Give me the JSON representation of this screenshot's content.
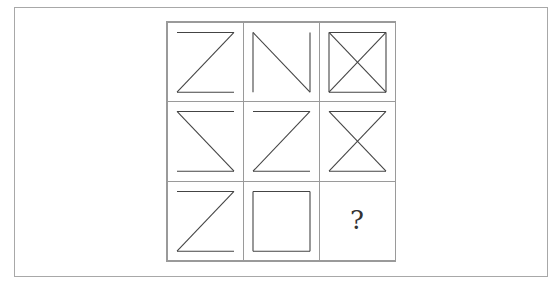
{
  "puzzle": {
    "type": "3x3 figure matrix",
    "missing_symbol": "?",
    "cells": [
      {
        "row": 1,
        "col": 1,
        "figure": "Z shape",
        "strokes": [
          "top",
          "diag-tr-bl",
          "bottom"
        ]
      },
      {
        "row": 1,
        "col": 2,
        "figure": "N shape",
        "strokes": [
          "left",
          "diag-tl-br",
          "right"
        ]
      },
      {
        "row": 1,
        "col": 3,
        "figure": "square with X",
        "strokes": [
          "top",
          "bottom",
          "left",
          "right",
          "diag-tl-br",
          "diag-tr-bl"
        ]
      },
      {
        "row": 2,
        "col": 1,
        "figure": "reverse Z shape",
        "strokes": [
          "top",
          "diag-tl-br",
          "bottom"
        ]
      },
      {
        "row": 2,
        "col": 2,
        "figure": "Z shape",
        "strokes": [
          "top",
          "diag-tr-bl",
          "bottom"
        ]
      },
      {
        "row": 2,
        "col": 3,
        "figure": "hourglass",
        "strokes": [
          "top",
          "diag-tl-br",
          "diag-tr-bl",
          "bottom"
        ]
      },
      {
        "row": 3,
        "col": 1,
        "figure": "Z shape",
        "strokes": [
          "top",
          "diag-tr-bl",
          "bottom"
        ]
      },
      {
        "row": 3,
        "col": 2,
        "figure": "square",
        "strokes": [
          "top",
          "bottom",
          "left",
          "right"
        ]
      },
      {
        "row": 3,
        "col": 3,
        "figure": "unknown",
        "strokes": []
      }
    ]
  }
}
